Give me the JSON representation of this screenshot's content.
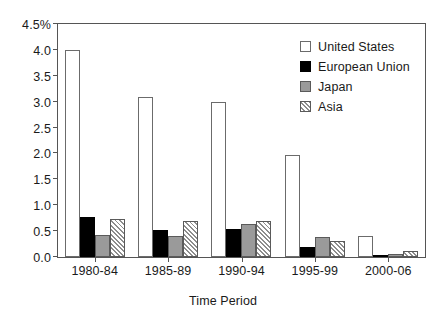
{
  "chart_data": {
    "type": "bar",
    "title": "",
    "xlabel": "Time Period",
    "ylabel": "",
    "categories": [
      "1980-84",
      "1985-89",
      "1990-94",
      "1995-99",
      "2000-06"
    ],
    "series": [
      {
        "name": "United States",
        "values": [
          4.0,
          3.1,
          3.0,
          1.97,
          0.41
        ]
      },
      {
        "name": "European Union",
        "values": [
          0.78,
          0.53,
          0.55,
          0.2,
          0.02
        ]
      },
      {
        "name": "Japan",
        "values": [
          0.43,
          0.4,
          0.63,
          0.38,
          0.06
        ]
      },
      {
        "name": "Asia",
        "values": [
          0.73,
          0.7,
          0.7,
          0.31,
          0.11
        ]
      }
    ],
    "ylim": [
      0.0,
      4.5
    ],
    "ytick_values": [
      0.0,
      0.5,
      1.0,
      1.5,
      2.0,
      2.5,
      3.0,
      3.5,
      4.0,
      4.5
    ],
    "ytick_labels": [
      "0.0",
      "0.5",
      "1.0",
      "1.5",
      "2.0",
      "2.5",
      "3.0",
      "3.5",
      "4.0",
      "4.5%"
    ],
    "grid": false,
    "legend_position": "top-right",
    "colors": {
      "United States": "#ffffff",
      "European Union": "#000000",
      "Japan": "#9a9a9a",
      "Asia": "#ffffff",
      "axis": "#555555",
      "text": "#1a1a1a"
    },
    "patterns": {
      "United States": "solid-empty",
      "European Union": "solid-fill",
      "Japan": "solid-fill",
      "Asia": "diagonal-hatch"
    }
  },
  "axis": {
    "x_title": "Time Period"
  },
  "legend": {
    "items": [
      {
        "label": "United States",
        "swatch": "series-us"
      },
      {
        "label": "European Union",
        "swatch": "series-eu"
      },
      {
        "label": "Japan",
        "swatch": "series-jp"
      },
      {
        "label": "Asia",
        "swatch": "series-asia"
      }
    ]
  }
}
